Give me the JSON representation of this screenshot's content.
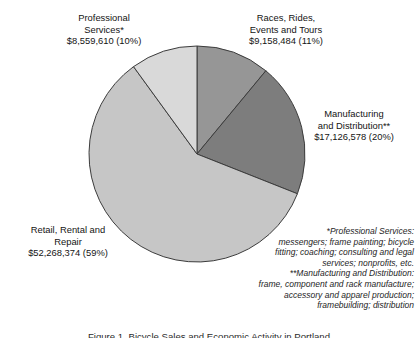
{
  "figure": {
    "background_color": "#ffffff",
    "outline_color": "#3c3c3c"
  },
  "labels": {
    "professional_services": "Professional\nServices*\n$8,559,610 (10%)",
    "races_rides": "Races, Rides,\nEvents and Tours\n$9,158,484 (11%)",
    "manufacturing": "Manufacturing\nand Distribution**\n$17,126,578 (20%)",
    "retail_rental": "Retail, Rental and\nRepair\n$52,268,374 (59%)"
  },
  "footnotes": {
    "professional_services_note": "*Professional Services:\nmessengers; frame painting; bicycle\nfitting; coaching; consulting and legal\nservices; nonprofits, etc.",
    "manufacturing_note": "**Manufacturing and Distribution:\nframe, component and rack manufacture;\naccessory and apparel production;\nframebuilding; distribution"
  },
  "caption": {
    "text": "Figure 1. Bicycle Sales and Economic Activity in Portland"
  },
  "chart_data": {
    "type": "pie",
    "title": "",
    "legend_position": "callout-labels-outside",
    "grid": false,
    "start_angle_deg": 0,
    "direction": "clockwise",
    "total_value": 87112,
    "total_value_display": "$87,113,046",
    "categories": [
      "Races, Rides, Events and Tours",
      "Manufacturing and Distribution",
      "Retail, Rental and Repair",
      "Professional Services"
    ],
    "values": [
      9158484,
      17126578,
      52268374,
      8559610
    ],
    "percentages": [
      11,
      20,
      59,
      10
    ],
    "value_labels": [
      "$9,158,484 (11%)",
      "$17,126,578 (20%)",
      "$52,268,374 (59%)",
      "$8,559,610 (10%)"
    ],
    "colors": [
      "#969696",
      "#7d7d7d",
      "#c6c6c6",
      "#d9d9d9"
    ],
    "slices": [
      {
        "name": "Races, Rides, Events and Tours",
        "value": 9158484,
        "percent": 11,
        "color": "#969696",
        "start_angle_deg": 0,
        "end_angle_deg": 39.6
      },
      {
        "name": "Manufacturing and Distribution",
        "value": 17126578,
        "percent": 20,
        "color": "#7d7d7d",
        "start_angle_deg": 39.6,
        "end_angle_deg": 111.6
      },
      {
        "name": "Retail, Rental and Repair",
        "value": 52268374,
        "percent": 59,
        "color": "#c6c6c6",
        "start_angle_deg": 111.6,
        "end_angle_deg": 324.0
      },
      {
        "name": "Professional Services",
        "value": 8559610,
        "percent": 10,
        "color": "#d9d9d9",
        "start_angle_deg": 324.0,
        "end_angle_deg": 360.0
      }
    ]
  }
}
